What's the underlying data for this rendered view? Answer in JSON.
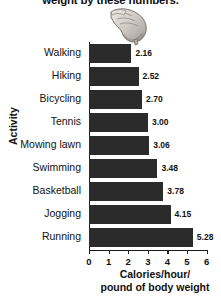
{
  "title": "weight by these numbers.",
  "decoration": {
    "hand_icon": "pointing-hand-icon"
  },
  "chart_data": {
    "type": "bar",
    "orientation": "horizontal",
    "title": "weight by these numbers.",
    "categories": [
      "Walking",
      "Hiking",
      "Bicycling",
      "Tennis",
      "Mowing lawn",
      "Swimming",
      "Basketball",
      "Jogging",
      "Running"
    ],
    "values": [
      2.16,
      2.52,
      2.7,
      3.0,
      3.06,
      3.48,
      3.78,
      4.15,
      5.28
    ],
    "value_labels": [
      "2.16",
      "2.52",
      "2.70",
      "3.00",
      "3.06",
      "3.48",
      "3.78",
      "4.15",
      "5.28"
    ],
    "xlabel_line1": "Calories/hour/",
    "xlabel_line2": "pound of body weight",
    "ylabel": "Activity",
    "xlim": [
      0,
      6
    ],
    "xticks": [
      0,
      1,
      2,
      3,
      4,
      5,
      6
    ],
    "xtick_labels": [
      "0",
      "1",
      "2",
      "3",
      "4",
      "5",
      "6"
    ],
    "grid": false,
    "legend": false,
    "bar_color": "#2b2b2b",
    "axis_color": "#1a1a1a",
    "background": "#ffffff"
  }
}
